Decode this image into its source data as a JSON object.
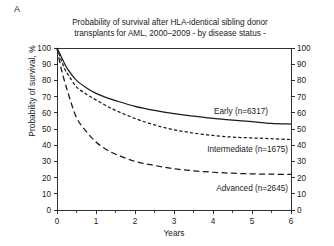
{
  "panel": {
    "label": "A"
  },
  "chart_data": {
    "type": "line",
    "title_line1": "Probability of survival after HLA-identical sibling donor",
    "title_line2": "transplants for AML, 2000–2009 - by disease status -",
    "xlabel": "Years",
    "ylabel": "Probability of survival, %",
    "xlim": [
      0,
      6
    ],
    "ylim": [
      0,
      100
    ],
    "xticks": [
      0,
      1,
      2,
      3,
      4,
      5,
      6
    ],
    "xtick_labels": [
      "0",
      "1",
      "2",
      "3",
      "4",
      "5",
      "6"
    ],
    "xminor_ticks": [
      0.5,
      1.5,
      2.5,
      3.5,
      4.5,
      5.5
    ],
    "yticks": [
      0,
      10,
      20,
      30,
      40,
      50,
      60,
      70,
      80,
      90,
      100
    ],
    "ytick_labels": [
      "0",
      "10",
      "20",
      "30",
      "40",
      "50",
      "60",
      "70",
      "80",
      "90",
      "100"
    ],
    "right_axis_ticks": [
      0,
      10,
      20,
      30,
      40,
      50,
      60,
      70,
      80,
      90,
      100
    ],
    "right_axis_tick_labels": [
      "0",
      "10",
      "20",
      "30",
      "40",
      "50",
      "60",
      "70",
      "80",
      "90",
      "100"
    ],
    "grid": false,
    "legend_position": "inline-labels",
    "reference_line_top": 100,
    "x": [
      0,
      0.1,
      0.2,
      0.3,
      0.5,
      0.75,
      1,
      1.25,
      1.5,
      2,
      2.5,
      3,
      3.5,
      4,
      4.5,
      5,
      5.5,
      6
    ],
    "series": [
      {
        "name": "Early",
        "n": 6317,
        "label": "Early (n=6317)",
        "linestyle": "solid",
        "color": "#1a1a1a",
        "values": [
          100,
          95,
          90,
          86,
          80,
          75.5,
          72,
          69.5,
          67.5,
          64,
          61.5,
          59.5,
          58,
          56.5,
          55.5,
          54.5,
          53.5,
          53
        ]
      },
      {
        "name": "Intermediate",
        "n": 1675,
        "label": "Intermediate (n=1675)",
        "linestyle": "short-dash",
        "color": "#1a1a1a",
        "values": [
          100,
          93,
          87,
          83,
          76,
          71.5,
          68,
          64.5,
          61.5,
          56.5,
          52.5,
          49.5,
          47.5,
          46,
          45,
          44.5,
          44,
          43.5
        ]
      },
      {
        "name": "Advanced",
        "n": 2645,
        "label": "Advanced (n=2645)",
        "linestyle": "long-dash",
        "color": "#1a1a1a",
        "values": [
          100,
          88,
          79,
          71,
          57,
          48.5,
          42,
          37.5,
          34.5,
          30,
          27.5,
          25.5,
          24.2,
          23.3,
          22.7,
          22.3,
          22.1,
          22
        ]
      }
    ]
  }
}
